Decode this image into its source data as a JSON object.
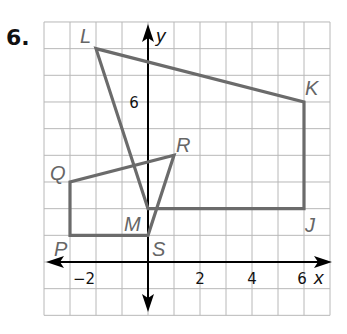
{
  "problem": {
    "number": "6."
  },
  "graph": {
    "x_range": [
      -4,
      7
    ],
    "y_range": [
      -2,
      9
    ],
    "axis_labels": {
      "x": "x",
      "y": "y"
    },
    "x_tick_labels": [
      {
        "value": -2,
        "text": "−2"
      },
      {
        "value": 2,
        "text": "2"
      },
      {
        "value": 4,
        "text": "4"
      },
      {
        "value": 6,
        "text": "6"
      }
    ],
    "y_tick_labels": [
      {
        "value": 6,
        "text": "6"
      }
    ],
    "colors": {
      "polygon": "#6b6b6b",
      "axis": "#000000",
      "grid": "#b8b8b8",
      "label": "#666666"
    }
  },
  "figures": [
    {
      "name": "JKLM",
      "vertices": [
        {
          "label": "L",
          "x": -2,
          "y": 8
        },
        {
          "label": "K",
          "x": 6,
          "y": 6
        },
        {
          "label": "J",
          "x": 6,
          "y": 2
        },
        {
          "label": "M",
          "x": 0,
          "y": 2
        }
      ]
    },
    {
      "name": "PQRS",
      "vertices": [
        {
          "label": "P",
          "x": -3,
          "y": 1
        },
        {
          "label": "Q",
          "x": -3,
          "y": 3
        },
        {
          "label": "R",
          "x": 1,
          "y": 4
        },
        {
          "label": "S",
          "x": 0,
          "y": 1
        }
      ]
    }
  ],
  "labels": {
    "L": "L",
    "K": "K",
    "J": "J",
    "M": "M",
    "P": "P",
    "Q": "Q",
    "R": "R",
    "S": "S"
  }
}
